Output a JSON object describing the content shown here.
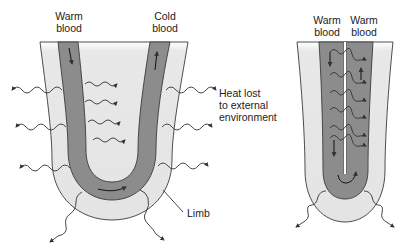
{
  "left_diagram": {
    "label_left": [
      "Warm",
      "blood"
    ],
    "label_right": [
      "Cold",
      "blood"
    ],
    "heat_label": [
      "Heat lost",
      "to external",
      "environment"
    ],
    "limb_label": "Limb"
  },
  "right_diagram": {
    "label_left": [
      "Warm",
      "blood"
    ],
    "label_right": [
      "Warm",
      "blood"
    ]
  },
  "colors": {
    "limb_fill": "#e6e6e6",
    "vessel_fill": "#8c8c8c",
    "outline": "#3a3a3a",
    "text": "#222222"
  }
}
